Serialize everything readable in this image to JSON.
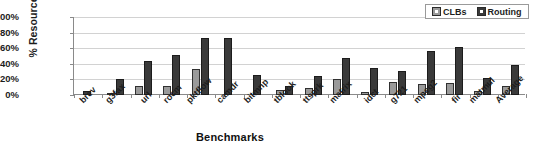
{
  "chart_data": {
    "type": "bar",
    "title": "",
    "xlabel": "Benchmarks",
    "ylabel": "% Resources",
    "ylim": [
      0,
      100
    ],
    "ytick_labels": [
      "100%",
      "80%",
      "60%",
      "40%",
      "20%",
      "0%"
    ],
    "ytick_values": [
      100,
      80,
      60,
      40,
      20,
      0
    ],
    "grid": true,
    "legend_position": "top-right",
    "categories": [
      "brev",
      "g3fax",
      "url",
      "rocm",
      "pktflow",
      "camdr",
      "bitmnp",
      "tblook",
      "ttsprk",
      "matrix",
      "idct",
      "g721",
      "mpeg2",
      "fir",
      "matmul",
      "Average"
    ],
    "series": [
      {
        "name": "CLBs",
        "color": "#9a9a9a",
        "values": [
          0,
          3,
          12,
          12,
          33,
          0,
          0,
          6,
          9,
          20,
          4,
          17,
          14,
          15,
          5,
          12
        ]
      },
      {
        "name": "Routing",
        "color": "#3a3a3a",
        "values": [
          5,
          20,
          44,
          51,
          73,
          73,
          26,
          11,
          25,
          47,
          35,
          31,
          57,
          62,
          22,
          38
        ]
      }
    ]
  },
  "legend": {
    "items": [
      {
        "label": "CLBs"
      },
      {
        "label": "Routing"
      }
    ]
  },
  "axis": {
    "y_title": "% Resources",
    "x_title": "Benchmarks"
  }
}
